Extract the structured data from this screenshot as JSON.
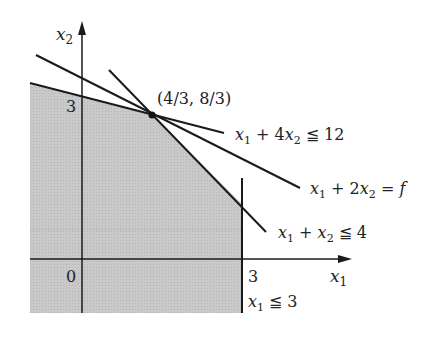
{
  "axes": {
    "x_label": "x",
    "x_sub": "1",
    "y_label": "x",
    "y_sub": "2",
    "origin_label": "0",
    "x_tick": "3",
    "y_tick": "3"
  },
  "point": {
    "label": "(4/3, 8/3)",
    "x": 1.3333,
    "y": 2.6667
  },
  "constraints": [
    {
      "id": "c1",
      "text_a": "x",
      "text_b": "1",
      "text_c": " + 4",
      "text_d": "x",
      "text_e": "2",
      "text_f": " ≦ 12"
    },
    {
      "id": "c2",
      "text_a": "x",
      "text_b": "1",
      "text_c": " + ",
      "text_d": "x",
      "text_e": "2",
      "text_f": " ≦ 4"
    },
    {
      "id": "c3",
      "text_a": "x",
      "text_b": "1",
      "text_f": " ≦ 3"
    }
  ],
  "objective": {
    "text_a": "x",
    "text_b": "1",
    "text_c": " + 2",
    "text_d": "x",
    "text_e": "2",
    "text_f": " = ",
    "text_g": "f"
  },
  "colors": {
    "region_fill": "#c8c8c8",
    "line": "#1a1a1a"
  }
}
